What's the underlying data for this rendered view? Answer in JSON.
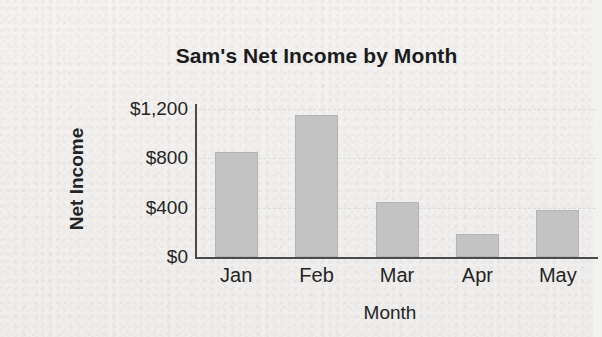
{
  "chart_data": {
    "type": "bar",
    "title": "Sam's Net Income by Month",
    "xlabel": "Month",
    "ylabel": "Net Income",
    "categories": [
      "Jan",
      "Feb",
      "Mar",
      "Apr",
      "May"
    ],
    "values": [
      850,
      1150,
      450,
      190,
      380
    ],
    "ylim": [
      0,
      1300
    ],
    "yticks": [
      0,
      400,
      800,
      1200
    ],
    "ytick_labels": [
      "$0",
      "$400",
      "$800",
      "$1,200"
    ],
    "grid": "horizontal-dotted",
    "legend": "none",
    "series": [
      {
        "name": "Net Income",
        "values": [
          850,
          1150,
          450,
          190,
          380
        ],
        "color": "#c3c3c3"
      }
    ],
    "bars": [
      {
        "category": "Jan",
        "value": 850,
        "label": "Jan"
      },
      {
        "category": "Feb",
        "value": 1150,
        "label": "Feb"
      },
      {
        "category": "Mar",
        "value": 450,
        "label": "Mar"
      },
      {
        "category": "Apr",
        "value": 190,
        "label": "Apr"
      },
      {
        "category": "May",
        "value": 380,
        "label": "May"
      }
    ]
  },
  "colors": {
    "bar_fill": "#c3c3c3",
    "axis": "#4a4a4a",
    "gridline": "#dcdcda",
    "text": "#242424",
    "title_text": "#1c1c1c",
    "background": "#f2f2f0"
  }
}
